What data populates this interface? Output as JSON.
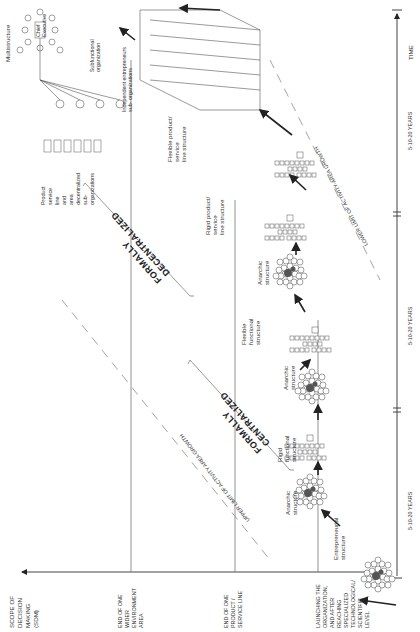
{
  "figure": {
    "orientation": "rotated 90 degrees counter-clockwise",
    "vertical_axis": {
      "title": "SCOPE OF DECISION MAKING (SDM)",
      "title_lines": [
        "SCOPE OF",
        "DECISION",
        "MAKING",
        "(SDM)"
      ]
    },
    "levels": [
      {
        "id": "launch",
        "lines": [
          "LAUNCHING THE",
          "ORGANIZATION,",
          "AND AFTER",
          "REACHING",
          "SPECIALIZED",
          "TECHNOLOGICAL/",
          "SCIENTIFIC",
          "LEVEL"
        ]
      },
      {
        "id": "product-line",
        "lines": [
          "END OF ONE",
          "PRODUCT /",
          "SERVICE LINE"
        ]
      },
      {
        "id": "environment",
        "lines": [
          "END OF ONE",
          "WIDER",
          "ENVIRONMENT",
          "AREA"
        ]
      }
    ],
    "time_axis": {
      "label": "TIME",
      "segments": [
        "5-10-20 YEARS",
        "5-10-20 YEARS",
        "5-10-20 YEARS"
      ]
    },
    "limits": {
      "upper": "UPPER LIMIT OF ACTIVITY AREA GROWTH",
      "lower": "LOWER LIMIT OF ACTIVITY-AREA GROWTH"
    },
    "phases": {
      "centralized": [
        "FORMALLY",
        "CENTRALIZED"
      ],
      "decentralized": [
        "FORMALLY",
        "DECENTRALIZED"
      ]
    },
    "structures": [
      {
        "id": "entrepreneurial",
        "lines": [
          "Entrepreneurial",
          "structure"
        ]
      },
      {
        "id": "anarchic-1",
        "lines": [
          "Anarchic",
          "structure"
        ]
      },
      {
        "id": "rigid-functional",
        "lines": [
          "Rigid",
          "functional",
          "structure"
        ]
      },
      {
        "id": "anarchic-2",
        "lines": [
          "Anarchic",
          "structure"
        ]
      },
      {
        "id": "flexible-functional",
        "lines": [
          "Flexible",
          "functional",
          "structure"
        ]
      },
      {
        "id": "anarchic-3",
        "lines": [
          "Anarchic",
          "structure"
        ]
      },
      {
        "id": "rigid-product",
        "lines": [
          "Rigid product/",
          "service",
          "line structure"
        ]
      },
      {
        "id": "flexible-product",
        "lines": [
          "Flexible product/",
          "service",
          "line structure"
        ]
      }
    ],
    "multistructure": {
      "title": "Multistructure",
      "chief": [
        "Chief",
        "Executive"
      ],
      "product_line_orgs": [
        "Product",
        "service",
        "line",
        "and",
        "area",
        "decentralized",
        "sub-",
        "organizations"
      ],
      "subfunctional": [
        "Subfunctional",
        "organization"
      ],
      "entrepreneurs": [
        "Independent entrepreneurs",
        "sub- organizations"
      ]
    }
  }
}
